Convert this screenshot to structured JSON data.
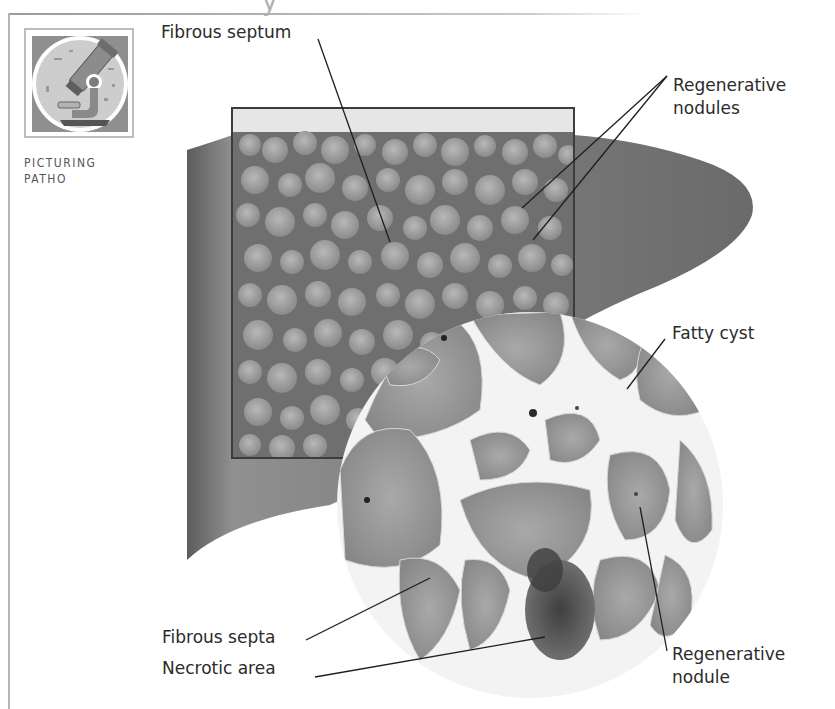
{
  "page": {
    "section_heading_fragment": "y"
  },
  "badge": {
    "icon": "microscope-icon",
    "caption_line1": "PICTURING",
    "caption_line2": "PATHO",
    "colors": {
      "frame": "#8f8f8f",
      "disc": "#c9c9c9",
      "ring": "#ffffff",
      "microscope": "#7d7d7d"
    }
  },
  "illustration": {
    "subject": "Cirrhotic liver with magnified cross-section",
    "colors": {
      "liver": "#7a7a7a",
      "nodule": "#a8a8a8",
      "septa": "#f2f2f2",
      "necrotic": "#4a4a4a",
      "inset_frame": "#3c3c3c"
    }
  },
  "labels": {
    "fibrous_septum": "Fibrous septum",
    "regenerative_nodules_line1": "Regenerative",
    "regenerative_nodules_line2": "nodules",
    "fatty_cyst": "Fatty cyst",
    "fibrous_septa": "Fibrous septa",
    "necrotic_area": "Necrotic area",
    "regenerative_nodule_line1": "Regenerative",
    "regenerative_nodule_line2": "nodule"
  }
}
